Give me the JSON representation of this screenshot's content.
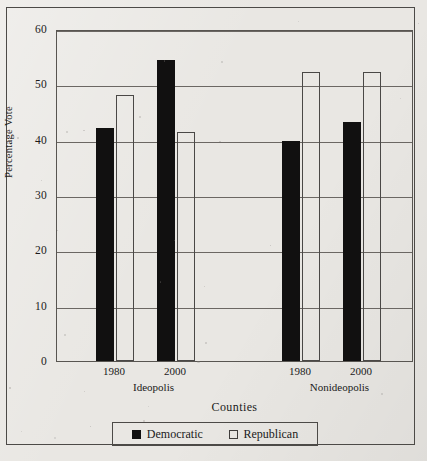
{
  "chart_data": {
    "type": "bar",
    "title": "",
    "xlabel": "Counties",
    "ylabel": "Percentage Vote",
    "ylim": [
      0,
      60
    ],
    "ytick_labels": [
      "60",
      "50",
      "40",
      "30",
      "20",
      "10",
      "0"
    ],
    "ytick_values": [
      60,
      50,
      40,
      30,
      20,
      10,
      0
    ],
    "grid": true,
    "legend_position": "bottom",
    "groups": [
      {
        "name": "Ideopolis",
        "years": [
          "1980",
          "2000"
        ]
      },
      {
        "name": "Nonideopolis",
        "years": [
          "1980",
          "2000"
        ]
      }
    ],
    "categories": [
      "Ideopolis 1980",
      "Ideopolis 2000",
      "Nonideopolis 1980",
      "Nonideopolis 2000"
    ],
    "series": [
      {
        "name": "Democratic",
        "color": "#111010",
        "values": [
          42.2,
          54.4,
          39.7,
          43.2
        ]
      },
      {
        "name": "Republican",
        "color": "#ffffff",
        "values": [
          48.0,
          41.3,
          52.3,
          52.3
        ]
      }
    ]
  },
  "axes": {
    "y_title": "Percentage Vote",
    "x_title": "Counties",
    "y_ticks": [
      {
        "label": "60",
        "value": 60
      },
      {
        "label": "50",
        "value": 50
      },
      {
        "label": "40",
        "value": 40
      },
      {
        "label": "30",
        "value": 30
      },
      {
        "label": "20",
        "value": 20
      },
      {
        "label": "10",
        "value": 10
      },
      {
        "label": "0",
        "value": 0
      }
    ],
    "x_year_labels": [
      "1980",
      "2000",
      "1980",
      "2000"
    ],
    "x_group_labels": [
      "Ideopolis",
      "Nonideopolis"
    ]
  },
  "legend": {
    "items": [
      {
        "label": "Democratic",
        "swatch": "filled-square-icon"
      },
      {
        "label": "Republican",
        "swatch": "hollow-square-icon"
      }
    ]
  }
}
